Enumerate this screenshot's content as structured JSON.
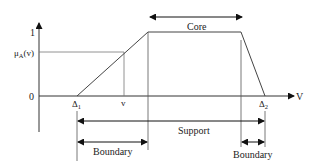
{
  "diagram": {
    "type": "trapezoidal fuzzy membership function",
    "axes": {
      "y_top_label": "1",
      "y_zero_label": "0",
      "y_mu_label": "μ",
      "y_mu_sub": "A",
      "y_mu_arg": "(v)",
      "x_axis_label": "V"
    },
    "points": {
      "delta1_main": "Δ",
      "delta1_sub": "1",
      "v_label": "v",
      "delta2_main": "Δ",
      "delta2_sub": "2"
    },
    "regions": {
      "core": "Core",
      "support": "Support",
      "boundary_left": "Boundary",
      "boundary_right": "Boundary"
    }
  }
}
